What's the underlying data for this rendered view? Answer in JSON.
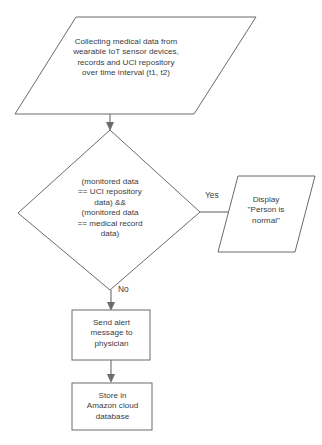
{
  "diagram": {
    "background_color": "#ffffff",
    "line_color": "#6b6b70",
    "text_color": "#3b3b3e",
    "nodes": {
      "collect": {
        "shape": "parallelogram",
        "text": "Collecting medical data from\nwearable IoT sensor devices,\nrecords and UCI repository\nover time interval (t1, t2)"
      },
      "decision": {
        "shape": "diamond",
        "text": "(monitored data\n== UCI repository\ndata) &&\n(monitored data\n== medical record\ndata)"
      },
      "display": {
        "shape": "parallelogram",
        "text": "Display\n\"Person is\nnormal\""
      },
      "alert": {
        "shape": "rectangle",
        "text": "Send alert\nmessage to\nphysician"
      },
      "store": {
        "shape": "rectangle",
        "text": "Store in\nAmazon cloud\ndatabase"
      }
    },
    "edges": {
      "collect_to_decision": {
        "label": ""
      },
      "decision_to_display": {
        "label": "Yes"
      },
      "decision_to_alert": {
        "label": "No"
      },
      "alert_to_store": {
        "label": ""
      }
    }
  }
}
